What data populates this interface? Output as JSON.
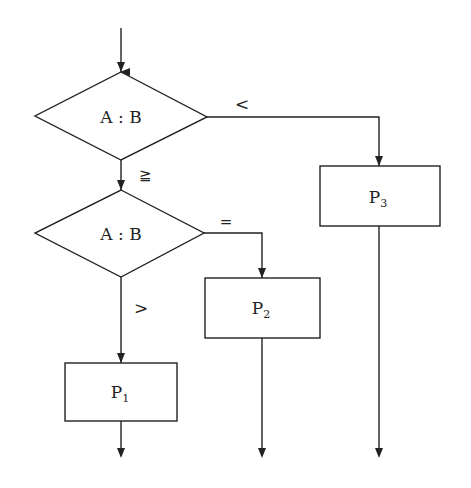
{
  "diagram": {
    "type": "flowchart",
    "decisions": [
      {
        "id": "d1",
        "label": "A : B"
      },
      {
        "id": "d2",
        "label": "A : B"
      }
    ],
    "edge_labels": {
      "d1_right": "<",
      "d1_down": "≧",
      "d2_right": "=",
      "d2_down": ">"
    },
    "processes": [
      {
        "id": "p1",
        "label": "P",
        "sub": "1"
      },
      {
        "id": "p2",
        "label": "P",
        "sub": "2"
      },
      {
        "id": "p3",
        "label": "P",
        "sub": "3"
      }
    ],
    "colors": {
      "stroke": "#222222",
      "background": "#ffffff"
    }
  }
}
